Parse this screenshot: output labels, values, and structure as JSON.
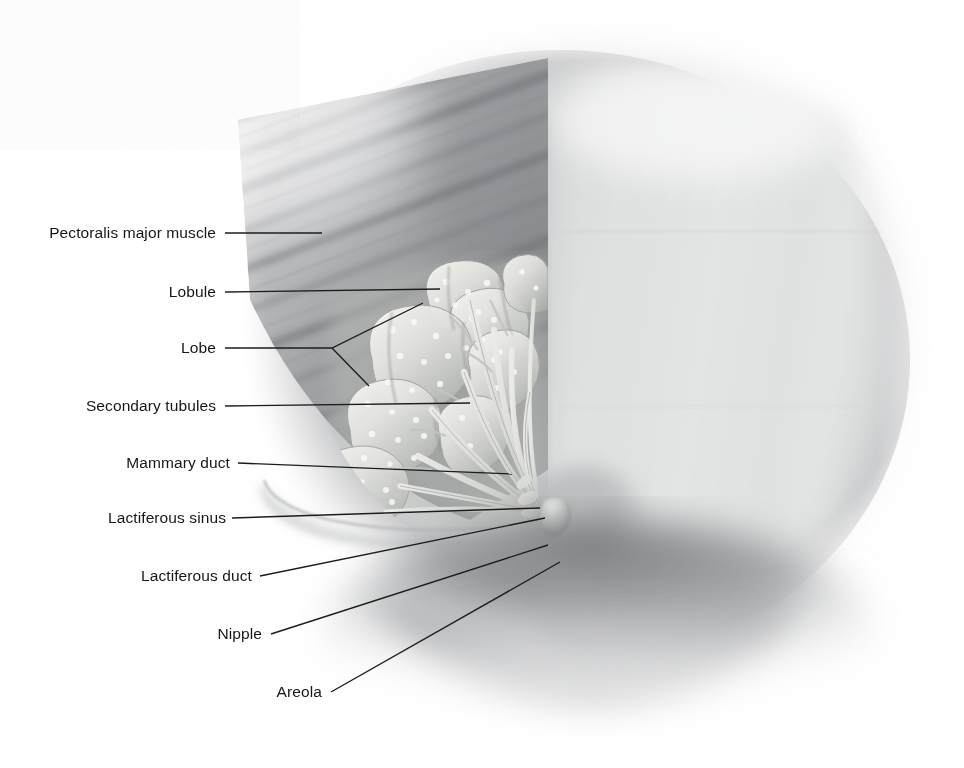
{
  "figure": {
    "width": 964,
    "height": 768,
    "background_color": "#ffffff",
    "label_color": "#17171a",
    "leader_color": "#1c1c1c",
    "tissue_tones": {
      "chest_wall_light": "#dcdddd",
      "pectoralis_mid": "#9a9c9e",
      "pectoralis_dark": "#7b7d80",
      "glandular_highlight": "#f2f2ef",
      "glandular_mid": "#c9cac5",
      "breast_shadow": "#8c8e91",
      "deep_shadow": "#6d6f72"
    }
  },
  "labels": [
    {
      "id": "pectoralis-major-muscle",
      "text": "Pectoralis major muscle",
      "text_x": 216,
      "text_y": 233,
      "leader": "M 225 233 L 322 233"
    },
    {
      "id": "lobule",
      "text": "Lobule",
      "text_x": 216,
      "text_y": 292,
      "leader": "M 225 292 L 440 289"
    },
    {
      "id": "lobe",
      "text": "Lobe",
      "text_x": 216,
      "text_y": 348,
      "leader": "M 225 348 L 332 348 L 423 303 M 332 348 L 369 386"
    },
    {
      "id": "secondary-tubules",
      "text": "Secondary tubules",
      "text_x": 216,
      "text_y": 406,
      "leader": "M 225 406 L 470 403"
    },
    {
      "id": "mammary-duct",
      "text": "Mammary duct",
      "text_x": 230,
      "text_y": 463,
      "leader": "M 238 463 L 512 474"
    },
    {
      "id": "lactiferous-sinus",
      "text": "Lactiferous sinus",
      "text_x": 226,
      "text_y": 518,
      "leader": "M 232 518 L 540 508"
    },
    {
      "id": "lactiferous-duct",
      "text": "Lactiferous duct",
      "text_x": 252,
      "text_y": 576,
      "leader": "M 260 576 L 545 518"
    },
    {
      "id": "nipple",
      "text": "Nipple",
      "text_x": 262,
      "text_y": 634,
      "leader": "M 271 634 L 548 545"
    },
    {
      "id": "areola",
      "text": "Areola",
      "text_x": 322,
      "text_y": 692,
      "leader": "M 331 692 L 560 562"
    }
  ]
}
